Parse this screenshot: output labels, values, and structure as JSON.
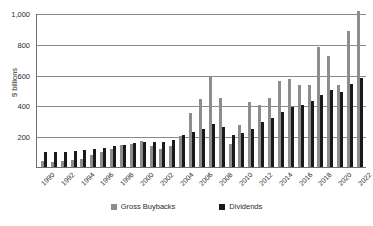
{
  "chart_data": {
    "type": "bar",
    "title": "",
    "subtitle": "",
    "xlabel": "",
    "ylabel": "$ billions",
    "ylim": [
      0,
      1000
    ],
    "yticks": [
      200,
      400,
      600,
      800,
      1000
    ],
    "ytick_labels": [
      "200",
      "400",
      "600",
      "800",
      "1,000"
    ],
    "grid": true,
    "legend_position": "bottom",
    "categories": [
      "1990",
      "1991",
      "1992",
      "1993",
      "1994",
      "1995",
      "1996",
      "1997",
      "1998",
      "1999",
      "2000",
      "2001",
      "2002",
      "2003",
      "2004",
      "2005",
      "2006",
      "2007",
      "2008",
      "2009",
      "2010",
      "2011",
      "2012",
      "2013",
      "2014",
      "2015",
      "2016",
      "2017",
      "2018",
      "2019",
      "2020",
      "2021",
      "2022"
    ],
    "tick_labels_shown": [
      "1990",
      "1992",
      "1994",
      "1996",
      "1998",
      "2000",
      "2002",
      "2004",
      "2006",
      "2008",
      "2010",
      "2012",
      "2014",
      "2016",
      "2018",
      "2020",
      "2022"
    ],
    "series": [
      {
        "name": "Gross Buybacks",
        "color": "#8d8d8d",
        "values": [
          40,
          35,
          40,
          45,
          55,
          75,
          95,
          120,
          140,
          150,
          170,
          135,
          120,
          135,
          200,
          350,
          440,
          590,
          450,
          150,
          270,
          420,
          400,
          450,
          560,
          570,
          530,
          530,
          780,
          720,
          530,
          880,
          1010
        ]
      },
      {
        "name": "Dividends",
        "color": "#1a1a1a",
        "values": [
          95,
          95,
          100,
          105,
          110,
          115,
          125,
          135,
          145,
          155,
          165,
          165,
          160,
          175,
          210,
          225,
          250,
          280,
          260,
          210,
          220,
          250,
          290,
          320,
          360,
          390,
          400,
          430,
          470,
          500,
          490,
          540,
          580
        ]
      }
    ]
  },
  "legend": {
    "items": [
      {
        "label": "Gross Buybacks",
        "color": "#8d8d8d"
      },
      {
        "label": "Dividends",
        "color": "#1a1a1a"
      }
    ]
  }
}
